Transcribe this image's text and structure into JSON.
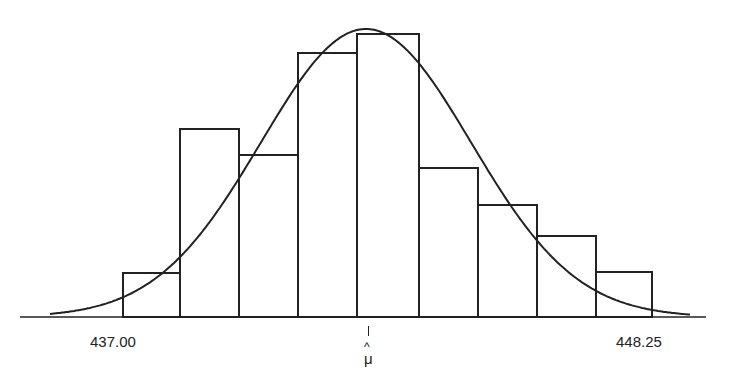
{
  "chart_data": {
    "type": "bar",
    "subtype": "histogram_with_normal_curve",
    "title": "",
    "xlabel": "",
    "ylabel": "",
    "grid": false,
    "legend": null,
    "x_tick_labels": [
      {
        "label": "437.00",
        "position": "left"
      },
      {
        "label": "μ̂",
        "position": "center",
        "annotation": "estimated mean"
      },
      {
        "label": "448.25",
        "position": "right"
      }
    ],
    "xlim": [
      437.0,
      448.25
    ],
    "bins": 9,
    "bar_edges_px": [
      123,
      180,
      239,
      298,
      357,
      419,
      478,
      537,
      596,
      652
    ],
    "values": [
      44,
      188,
      162,
      264,
      283,
      149,
      112,
      81,
      45
    ],
    "values_note": "relative bar heights (pixels above baseline)",
    "curve": {
      "type": "normal",
      "mean_px": 366,
      "peak_height": 288,
      "sigma_px": 105,
      "x_start_px": 50,
      "x_end_px": 690
    },
    "axis": {
      "baseline_px": 317,
      "x_start_px": 20,
      "x_end_px": 706
    },
    "colors": {
      "stroke": "#222222",
      "fill": "#ffffff"
    }
  },
  "labels": {
    "left": "437.00",
    "right": "448.25",
    "mu_hat": "^",
    "mu": "μ"
  }
}
